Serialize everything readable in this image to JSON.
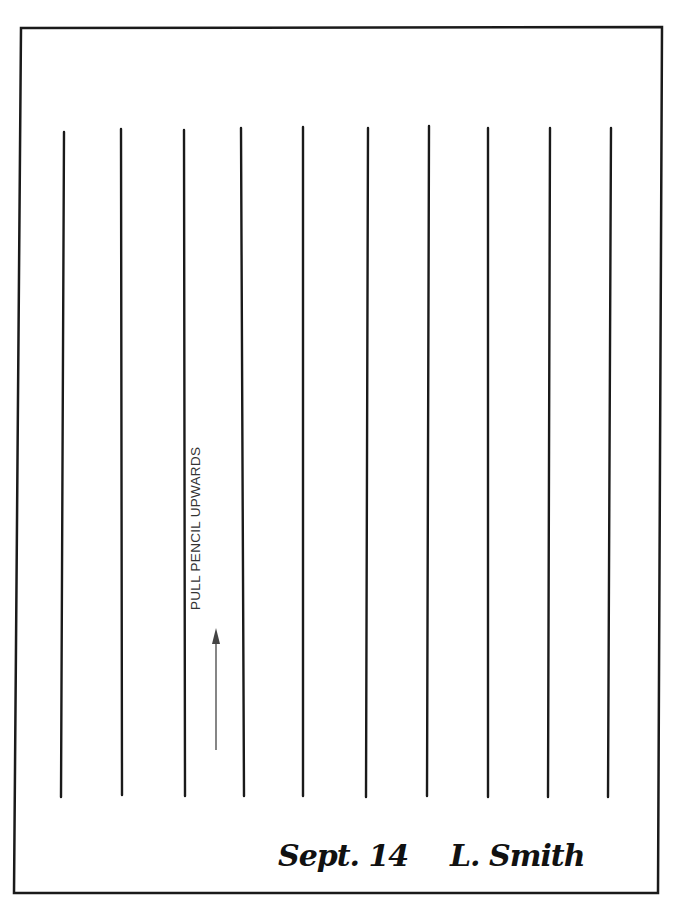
{
  "document": {
    "instruction_text": "PULL PENCIL UPWARDS",
    "date": "Sept. 14",
    "signature": "L. Smith",
    "arrow_direction": "up-arrow-icon",
    "frame_color": "#1a1a1a",
    "line_color": "#1a1a1a",
    "lines": [
      {
        "x1": 64,
        "y1": 132,
        "x2": 61,
        "y2": 797
      },
      {
        "x1": 121,
        "y1": 129,
        "x2": 122,
        "y2": 795
      },
      {
        "x1": 184,
        "y1": 130,
        "x2": 185,
        "y2": 796
      },
      {
        "x1": 241,
        "y1": 128,
        "x2": 244,
        "y2": 796
      },
      {
        "x1": 303,
        "y1": 127,
        "x2": 303,
        "y2": 796
      },
      {
        "x1": 368,
        "y1": 128,
        "x2": 366,
        "y2": 797
      },
      {
        "x1": 429,
        "y1": 126,
        "x2": 427,
        "y2": 796
      },
      {
        "x1": 488,
        "y1": 128,
        "x2": 488,
        "y2": 797
      },
      {
        "x1": 550,
        "y1": 128,
        "x2": 548,
        "y2": 797
      },
      {
        "x1": 611,
        "y1": 128,
        "x2": 608,
        "y2": 797
      }
    ]
  }
}
